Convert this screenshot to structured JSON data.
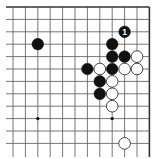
{
  "board": {
    "view": "top-right corner",
    "columns": 12,
    "rows": 12,
    "origin_x": 13,
    "origin_y": 7,
    "spacing": 12.4,
    "open_left": true,
    "open_bottom": true,
    "edge_top": true,
    "edge_right": true,
    "line_color": "#555555",
    "edge_color": "#333333",
    "black_color": "#111111",
    "white_color": "#ffffff",
    "star_points": [
      {
        "col": 2,
        "row": 9
      },
      {
        "col": 8,
        "row": 9
      }
    ],
    "stones": [
      {
        "col": 9,
        "row": 2,
        "color": "black",
        "label": "1"
      },
      {
        "col": 2,
        "row": 3,
        "color": "black"
      },
      {
        "col": 8,
        "row": 3,
        "color": "black"
      },
      {
        "col": 8,
        "row": 4,
        "color": "black"
      },
      {
        "col": 9,
        "row": 4,
        "color": "black"
      },
      {
        "col": 10,
        "row": 4,
        "color": "white"
      },
      {
        "col": 6,
        "row": 5,
        "color": "black"
      },
      {
        "col": 7,
        "row": 5,
        "color": "white"
      },
      {
        "col": 8,
        "row": 5,
        "color": "black"
      },
      {
        "col": 9,
        "row": 5,
        "color": "white"
      },
      {
        "col": 10,
        "row": 5,
        "color": "white"
      },
      {
        "col": 7,
        "row": 6,
        "color": "black"
      },
      {
        "col": 8,
        "row": 6,
        "color": "white"
      },
      {
        "col": 7,
        "row": 7,
        "color": "black"
      },
      {
        "col": 8,
        "row": 7,
        "color": "white"
      },
      {
        "col": 8,
        "row": 8,
        "color": "white"
      },
      {
        "col": 9,
        "row": 11,
        "color": "white"
      }
    ]
  }
}
